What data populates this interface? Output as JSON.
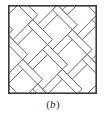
{
  "figure": {
    "caption_prefix": "(",
    "caption_label": "b",
    "caption_suffix": ")",
    "caption_full": "(b)",
    "panel_title": "herringbone-parquet-tiling"
  },
  "colors": {
    "background": "#ffffff",
    "frame_stroke": "#3a3a3a",
    "plank_stroke": "#555555",
    "plank_fill": "#fdfdfd",
    "caption_text": "#2b2b2b"
  },
  "chart_data": {
    "type": "diagram",
    "title": "(b)",
    "frame": {
      "shape": "square",
      "x": 8,
      "y": 5,
      "width": 89,
      "height": 89,
      "stroke_width": 1.6
    },
    "pattern": {
      "name": "herringbone",
      "plank_angles_deg": [
        45,
        -45
      ],
      "plank_width": 7,
      "plank_length": 28,
      "module_pitch": 14,
      "stroke_width": 0.8
    }
  }
}
